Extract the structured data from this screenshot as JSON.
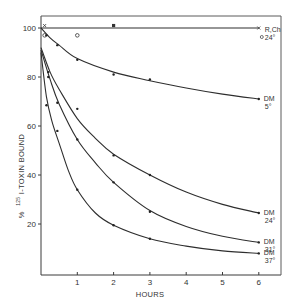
{
  "chart_data": {
    "type": "line",
    "title": "",
    "xlabel": "HOURS",
    "ylabel": "% 125I-TOXIN BOUND",
    "xlim": [
      0,
      6.4
    ],
    "ylim": [
      0,
      105
    ],
    "x_ticks": [
      1,
      2,
      3,
      4,
      5,
      6
    ],
    "y_ticks": [
      20,
      40,
      60,
      80,
      100
    ],
    "grid": false,
    "legend": "inline labels at right end of each curve",
    "series": [
      {
        "name": "R,Ch 24°",
        "label_line1": "R,Ch",
        "label_line2": "24°",
        "marker": "x / open circle",
        "points": [
          [
            0.1,
            101
          ],
          [
            0.1,
            97
          ],
          [
            1,
            97
          ],
          [
            2,
            101
          ],
          [
            6,
            100
          ]
        ],
        "curve": [
          [
            0,
            100
          ],
          [
            6,
            100
          ]
        ]
      },
      {
        "name": "DM 5°",
        "label_line1": "DM",
        "label_line2": "5°",
        "marker": "dot",
        "points": [
          [
            0.15,
            97
          ],
          [
            0.45,
            93
          ],
          [
            1,
            87
          ],
          [
            2,
            81
          ],
          [
            3,
            79
          ],
          [
            6,
            71
          ]
        ],
        "curve": [
          [
            0,
            100
          ],
          [
            0.25,
            96
          ],
          [
            0.5,
            93
          ],
          [
            1,
            87.5
          ],
          [
            2,
            82
          ],
          [
            3,
            78.5
          ],
          [
            4,
            75.5
          ],
          [
            5,
            73
          ],
          [
            6,
            71
          ]
        ]
      },
      {
        "name": "DM 24°",
        "label_line1": "DM",
        "label_line2": "24°",
        "marker": "dot",
        "points": [
          [
            0.2,
            82
          ],
          [
            1,
            67
          ],
          [
            2,
            48
          ],
          [
            3,
            40
          ],
          [
            6,
            24.5
          ]
        ],
        "curve": [
          [
            0,
            92
          ],
          [
            0.25,
            82
          ],
          [
            0.5,
            75
          ],
          [
            1,
            63
          ],
          [
            1.5,
            55
          ],
          [
            2,
            48.5
          ],
          [
            3,
            40
          ],
          [
            4,
            33
          ],
          [
            5,
            28
          ],
          [
            6,
            24.5
          ]
        ]
      },
      {
        "name": "DM 31°",
        "label_line1": "DM",
        "label_line2": "31°",
        "marker": "dot",
        "points": [
          [
            0.2,
            80
          ],
          [
            0.45,
            69.5
          ],
          [
            1,
            54.5
          ],
          [
            2,
            37
          ],
          [
            3,
            25
          ],
          [
            6,
            12.5
          ]
        ],
        "curve": [
          [
            0,
            91
          ],
          [
            0.25,
            79
          ],
          [
            0.5,
            69
          ],
          [
            1,
            54.5
          ],
          [
            1.5,
            45
          ],
          [
            2,
            37
          ],
          [
            3,
            25.5
          ],
          [
            4,
            19
          ],
          [
            5,
            15
          ],
          [
            6,
            12.5
          ]
        ]
      },
      {
        "name": "DM 37°",
        "label_line1": "DM",
        "label_line2": "37°",
        "marker": "dot",
        "points": [
          [
            0.15,
            68.5
          ],
          [
            0.45,
            58
          ],
          [
            1,
            34
          ],
          [
            2,
            19.5
          ],
          [
            3,
            14
          ],
          [
            6,
            8
          ]
        ],
        "curve": [
          [
            0,
            90
          ],
          [
            0.15,
            72
          ],
          [
            0.3,
            62
          ],
          [
            0.5,
            53
          ],
          [
            0.75,
            42
          ],
          [
            1,
            34
          ],
          [
            1.5,
            24.5
          ],
          [
            2,
            19.5
          ],
          [
            3,
            14
          ],
          [
            4,
            11
          ],
          [
            5,
            9
          ],
          [
            6,
            8
          ]
        ]
      }
    ]
  },
  "axes": {
    "x_title": "HOURS",
    "y_title_prefix": "%",
    "y_title_superscript": "125",
    "y_title_main": "I-TOXIN  BOUND"
  }
}
